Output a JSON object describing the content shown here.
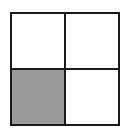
{
  "diagram": {
    "type": "2x2 grid",
    "rows": 2,
    "columns": 2,
    "cells": [
      {
        "row": 0,
        "col": 0,
        "shaded": false,
        "color": "#ffffff"
      },
      {
        "row": 0,
        "col": 1,
        "shaded": false,
        "color": "#ffffff"
      },
      {
        "row": 1,
        "col": 0,
        "shaded": true,
        "color": "#999999"
      },
      {
        "row": 1,
        "col": 1,
        "shaded": false,
        "color": "#ffffff"
      }
    ],
    "border_color": "#1a1a1a"
  }
}
